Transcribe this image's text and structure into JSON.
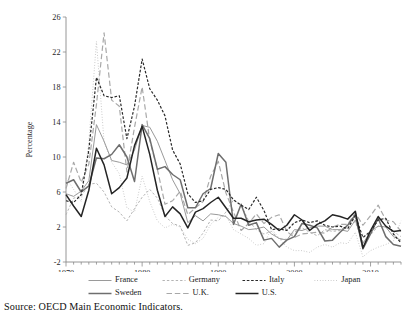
{
  "source_note": "Source: OECD Main Economic Indicators.",
  "chart_data": {
    "type": "line",
    "title": "",
    "subtitle": "",
    "xlabel": "",
    "ylabel": "Percentage",
    "xlim": [
      1970,
      2014
    ],
    "ylim": [
      -2,
      26
    ],
    "ytick_values": [
      -2,
      2,
      6,
      10,
      14,
      18,
      22,
      26
    ],
    "ytick_labels": [
      "-2",
      "2",
      "6",
      "10",
      "14",
      "18",
      "22",
      "26"
    ],
    "xtick_major_values": [
      1970,
      1980,
      1990,
      2000,
      2010
    ],
    "xtick_major_labels": [
      "1970",
      "1980",
      "1990",
      "2000",
      "2010"
    ],
    "xtick_minor_step": 1,
    "grid": false,
    "legend_position": "below",
    "x": [
      1970,
      1971,
      1972,
      1973,
      1974,
      1975,
      1976,
      1977,
      1978,
      1979,
      1980,
      1981,
      1982,
      1983,
      1984,
      1985,
      1986,
      1987,
      1988,
      1989,
      1990,
      1991,
      1992,
      1993,
      1994,
      1995,
      1996,
      1997,
      1998,
      1999,
      2000,
      2001,
      2002,
      2003,
      2004,
      2005,
      2006,
      2007,
      2008,
      2009,
      2010,
      2011,
      2012,
      2013,
      2014
    ],
    "series": [
      {
        "name": "France",
        "style": "solid",
        "color": "#9a9a9a",
        "width": 1.0,
        "values": [
          5.8,
          5.5,
          6.1,
          7.3,
          13.7,
          11.8,
          9.6,
          9.4,
          9.1,
          10.8,
          13.6,
          13.4,
          11.8,
          9.6,
          7.4,
          5.8,
          2.5,
          3.3,
          2.7,
          3.5,
          3.4,
          3.2,
          2.4,
          2.1,
          1.7,
          1.8,
          2.0,
          1.2,
          0.7,
          0.5,
          1.7,
          1.6,
          1.9,
          2.1,
          2.1,
          1.7,
          1.7,
          1.5,
          2.8,
          0.1,
          1.5,
          2.1,
          2.0,
          0.9,
          0.5
        ]
      },
      {
        "name": "Germany",
        "style": "dashed-fine",
        "color": "#b4b4b4",
        "width": 1.0,
        "values": [
          3.4,
          5.3,
          5.5,
          6.9,
          7.0,
          6.0,
          4.3,
          3.7,
          2.7,
          4.1,
          5.4,
          6.3,
          5.3,
          3.3,
          2.4,
          2.1,
          -0.1,
          0.2,
          1.3,
          2.8,
          2.7,
          3.7,
          5.1,
          4.5,
          2.7,
          1.7,
          1.2,
          1.5,
          0.6,
          0.6,
          1.4,
          1.9,
          1.4,
          1.0,
          1.7,
          1.5,
          1.6,
          2.3,
          2.6,
          0.3,
          1.1,
          2.1,
          2.0,
          1.5,
          0.9
        ]
      },
      {
        "name": "Italy",
        "style": "dashed-bold",
        "color": "#2a2a2a",
        "width": 1.2,
        "values": [
          5.0,
          4.8,
          5.7,
          10.8,
          19.1,
          17.0,
          16.8,
          17.0,
          12.1,
          15.8,
          21.2,
          17.8,
          16.5,
          14.7,
          10.8,
          9.2,
          5.8,
          4.8,
          5.0,
          6.3,
          6.5,
          6.3,
          5.1,
          4.5,
          4.0,
          5.4,
          3.9,
          1.7,
          1.8,
          1.6,
          2.5,
          2.8,
          2.5,
          2.7,
          2.2,
          2.0,
          2.1,
          1.8,
          3.3,
          0.8,
          1.5,
          2.8,
          3.0,
          1.2,
          0.2
        ]
      },
      {
        "name": "Japan",
        "style": "dotted",
        "color": "#c0c0c0",
        "width": 1.0,
        "values": [
          7.6,
          6.3,
          4.9,
          11.7,
          23.2,
          11.7,
          9.4,
          8.1,
          4.2,
          3.7,
          7.8,
          4.9,
          2.7,
          1.9,
          2.3,
          2.0,
          0.6,
          0.1,
          0.7,
          2.3,
          3.1,
          3.3,
          1.7,
          1.2,
          0.7,
          -0.1,
          0.1,
          1.8,
          0.7,
          -0.3,
          -0.7,
          -0.7,
          -0.9,
          -0.3,
          0.0,
          -0.3,
          0.2,
          0.1,
          1.4,
          -1.4,
          -0.7,
          -0.3,
          0.0,
          0.4,
          2.7
        ]
      },
      {
        "name": "Sweden",
        "style": "solid",
        "color": "#6e6e6e",
        "width": 1.5,
        "values": [
          7.0,
          7.4,
          6.0,
          6.7,
          9.9,
          9.8,
          10.3,
          11.4,
          10.0,
          7.2,
          13.7,
          12.1,
          8.6,
          8.9,
          8.0,
          7.4,
          4.2,
          4.2,
          5.8,
          6.4,
          10.4,
          9.4,
          2.3,
          4.6,
          2.2,
          2.5,
          0.5,
          0.7,
          -0.3,
          0.5,
          0.9,
          2.4,
          2.2,
          1.9,
          0.4,
          0.5,
          1.4,
          2.2,
          3.4,
          -0.5,
          1.2,
          3.0,
          0.9,
          0.0,
          -0.2
        ]
      },
      {
        "name": "U.K.",
        "style": "long-dash",
        "color": "#a8a8a8",
        "width": 1.2,
        "values": [
          6.4,
          9.4,
          7.1,
          9.2,
          16.0,
          24.2,
          16.5,
          15.8,
          8.3,
          13.4,
          18.0,
          11.9,
          8.6,
          4.6,
          5.0,
          6.1,
          3.4,
          4.2,
          4.9,
          7.8,
          9.5,
          5.9,
          3.7,
          1.6,
          2.4,
          3.5,
          2.4,
          3.1,
          3.4,
          1.5,
          0.8,
          1.2,
          1.3,
          1.4,
          1.3,
          2.0,
          2.3,
          2.3,
          3.6,
          2.2,
          3.3,
          4.5,
          2.8,
          2.6,
          1.5
        ]
      },
      {
        "name": "U.S.",
        "style": "solid",
        "color": "#242424",
        "width": 1.5,
        "values": [
          5.7,
          4.4,
          3.2,
          6.2,
          11.0,
          9.1,
          5.8,
          6.5,
          7.6,
          11.3,
          13.5,
          10.3,
          6.2,
          3.2,
          4.3,
          3.5,
          1.9,
          3.7,
          4.1,
          4.8,
          5.4,
          4.2,
          3.0,
          3.0,
          2.6,
          2.8,
          2.9,
          2.3,
          1.6,
          2.2,
          3.4,
          2.8,
          1.6,
          2.3,
          2.7,
          3.4,
          3.2,
          2.9,
          3.8,
          -0.4,
          1.6,
          3.2,
          2.1,
          1.5,
          1.6
        ]
      }
    ]
  },
  "legend": {
    "row1": [
      {
        "label": "France",
        "style": "solid",
        "color": "#9a9a9a",
        "width": 1.0
      },
      {
        "label": "Germany",
        "style": "dashed-fine",
        "color": "#b4b4b4",
        "width": 1.0
      },
      {
        "label": "Italy",
        "style": "dashed-bold",
        "color": "#2a2a2a",
        "width": 1.2
      },
      {
        "label": "Japan",
        "style": "dotted",
        "color": "#c0c0c0",
        "width": 1.0
      }
    ],
    "row2": [
      {
        "label": "Sweden",
        "style": "solid",
        "color": "#6e6e6e",
        "width": 1.5
      },
      {
        "label": "U.K.",
        "style": "long-dash",
        "color": "#a8a8a8",
        "width": 1.2
      },
      {
        "label": "U.S.",
        "style": "solid",
        "color": "#242424",
        "width": 1.5
      }
    ]
  }
}
